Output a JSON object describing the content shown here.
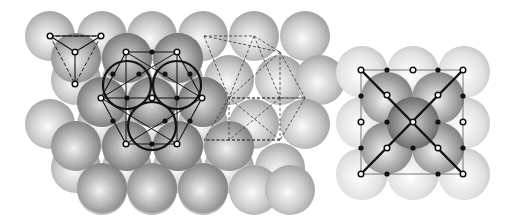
{
  "figure": {
    "width": 514,
    "height": 223,
    "background": "#ffffff",
    "panels": [
      {
        "id": "left",
        "description": "Close-packed layers of spheres with tetrahedral and octahedral site construction"
      },
      {
        "id": "right",
        "description": "Square (100) layer with central sphere and diagonal lines"
      }
    ]
  },
  "colors": {
    "sphere_light": "#f4f4f4",
    "sphere_mid": "#a8a8a8",
    "sphere_dark": "#6e6e6e",
    "line": "#111111",
    "dashed": "#333333",
    "marker_fill": "#ffffff"
  },
  "left_panel": {
    "sphere_radius": 25,
    "back_spheres": [
      [
        50,
        36
      ],
      [
        102,
        36
      ],
      [
        152,
        36
      ],
      [
        203,
        36
      ],
      [
        254,
        36
      ],
      [
        305,
        36
      ],
      [
        76,
        80
      ],
      [
        127,
        80
      ],
      [
        178,
        80
      ],
      [
        229,
        80
      ],
      [
        280,
        80
      ],
      [
        320,
        80
      ],
      [
        50,
        124
      ],
      [
        102,
        124
      ],
      [
        152,
        124
      ],
      [
        203,
        124
      ],
      [
        254,
        124
      ],
      [
        305,
        124
      ],
      [
        76,
        168
      ],
      [
        127,
        168
      ],
      [
        178,
        168
      ],
      [
        229,
        168
      ],
      [
        280,
        168
      ],
      [
        102,
        190
      ],
      [
        152,
        190
      ],
      [
        203,
        190
      ],
      [
        254,
        190
      ],
      [
        290,
        190
      ]
    ],
    "front_spheres": [
      [
        76,
        58
      ],
      [
        127,
        58
      ],
      [
        178,
        58
      ],
      [
        102,
        102
      ],
      [
        152,
        102
      ],
      [
        203,
        102
      ],
      [
        76,
        146
      ],
      [
        127,
        146
      ],
      [
        178,
        146
      ],
      [
        229,
        146
      ],
      [
        102,
        188
      ],
      [
        152,
        188
      ],
      [
        203,
        188
      ]
    ],
    "highlight_spheres": [
      [
        127,
        58
      ],
      [
        178,
        58
      ],
      [
        102,
        102
      ],
      [
        203,
        102
      ],
      [
        127,
        146
      ],
      [
        178,
        146
      ],
      [
        152,
        102
      ]
    ],
    "bold_circles": [
      {
        "cx": 127,
        "cy": 85,
        "r": 24
      },
      {
        "cx": 177,
        "cy": 85,
        "r": 24
      },
      {
        "cx": 152,
        "cy": 126,
        "r": 24
      }
    ],
    "hexagon": [
      [
        126,
        52
      ],
      [
        177,
        52
      ],
      [
        202,
        98
      ],
      [
        177,
        144
      ],
      [
        126,
        144
      ],
      [
        101,
        98
      ]
    ],
    "tetra_open": [
      [
        50,
        36
      ],
      [
        101,
        36
      ],
      [
        75,
        52
      ],
      [
        75,
        84
      ]
    ],
    "open_markers": [
      [
        50,
        36
      ],
      [
        101,
        36
      ],
      [
        75,
        52
      ],
      [
        75,
        84
      ],
      [
        126,
        52
      ],
      [
        177,
        52
      ],
      [
        101,
        98
      ],
      [
        152,
        98
      ],
      [
        202,
        98
      ],
      [
        126,
        144
      ],
      [
        177,
        144
      ]
    ],
    "filled_markers": [
      [
        152,
        52
      ],
      [
        113,
        74
      ],
      [
        139,
        74
      ],
      [
        165,
        74
      ],
      [
        190,
        74
      ],
      [
        127,
        98
      ],
      [
        177,
        98
      ],
      [
        113,
        121
      ],
      [
        165,
        121
      ],
      [
        190,
        121
      ],
      [
        152,
        144
      ]
    ],
    "dashed_polygon": [
      [
        204,
        36
      ],
      [
        254,
        36
      ],
      [
        280,
        52
      ],
      [
        280,
        98
      ],
      [
        305,
        98
      ],
      [
        280,
        140
      ],
      [
        229,
        140
      ],
      [
        204,
        140
      ],
      [
        229,
        98
      ]
    ]
  },
  "right_panel": {
    "sphere_radius": 26,
    "outer_spheres": [
      [
        362,
        72
      ],
      [
        413,
        72
      ],
      [
        464,
        72
      ],
      [
        362,
        123
      ],
      [
        464,
        123
      ],
      [
        362,
        174
      ],
      [
        413,
        174
      ],
      [
        464,
        174
      ]
    ],
    "middle_spheres": [
      [
        387,
        98
      ],
      [
        438,
        98
      ],
      [
        387,
        148
      ],
      [
        438,
        148
      ]
    ],
    "center_sphere": [
      413,
      123
    ],
    "square": [
      [
        361,
        70
      ],
      [
        463,
        70
      ],
      [
        463,
        174
      ],
      [
        361,
        174
      ]
    ],
    "diagonals": [
      [
        [
          361,
          70
        ],
        [
          463,
          174
        ]
      ],
      [
        [
          463,
          70
        ],
        [
          361,
          174
        ]
      ]
    ],
    "open_markers": [
      [
        361,
        70
      ],
      [
        413,
        70
      ],
      [
        463,
        70
      ],
      [
        387,
        95
      ],
      [
        438,
        95
      ],
      [
        361,
        122
      ],
      [
        413,
        122
      ],
      [
        463,
        122
      ],
      [
        387,
        148
      ],
      [
        438,
        148
      ],
      [
        361,
        174
      ],
      [
        463,
        174
      ]
    ],
    "filled_markers": [
      [
        387,
        70
      ],
      [
        438,
        70
      ],
      [
        361,
        96
      ],
      [
        463,
        96
      ],
      [
        387,
        122
      ],
      [
        438,
        122
      ],
      [
        361,
        148
      ],
      [
        463,
        148
      ],
      [
        387,
        174
      ],
      [
        438,
        174
      ],
      [
        413,
        148
      ]
    ]
  }
}
